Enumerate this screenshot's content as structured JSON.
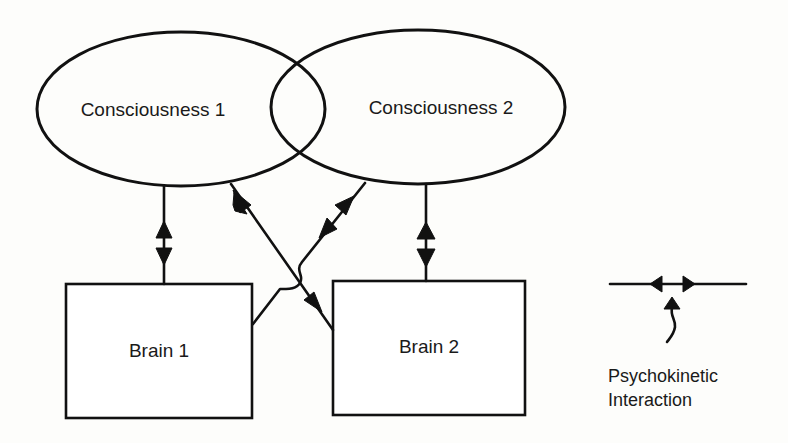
{
  "diagram": {
    "nodes": {
      "consciousness_1": {
        "label": "Consciousness 1",
        "shape": "ellipse"
      },
      "consciousness_2": {
        "label": "Consciousness 2",
        "shape": "ellipse"
      },
      "brain_1": {
        "label": "Brain 1",
        "shape": "rectangle"
      },
      "brain_2": {
        "label": "Brain 2",
        "shape": "rectangle"
      }
    },
    "edges": [
      {
        "from": "consciousness_1",
        "to": "brain_1",
        "type": "psychokinetic-interaction"
      },
      {
        "from": "consciousness_2",
        "to": "brain_2",
        "type": "psychokinetic-interaction"
      },
      {
        "from": "consciousness_1",
        "to": "brain_2",
        "type": "psychokinetic-interaction"
      },
      {
        "from": "consciousness_2",
        "to": "brain_1",
        "type": "psychokinetic-interaction"
      }
    ],
    "overlap": [
      "consciousness_1",
      "consciousness_2"
    ]
  },
  "legend": {
    "symbol": "double-arrowhead-line",
    "line1": "Psychokinetic",
    "line2": "Interaction"
  },
  "colors": {
    "ink": "#111111",
    "background": "#fdfdfb"
  }
}
